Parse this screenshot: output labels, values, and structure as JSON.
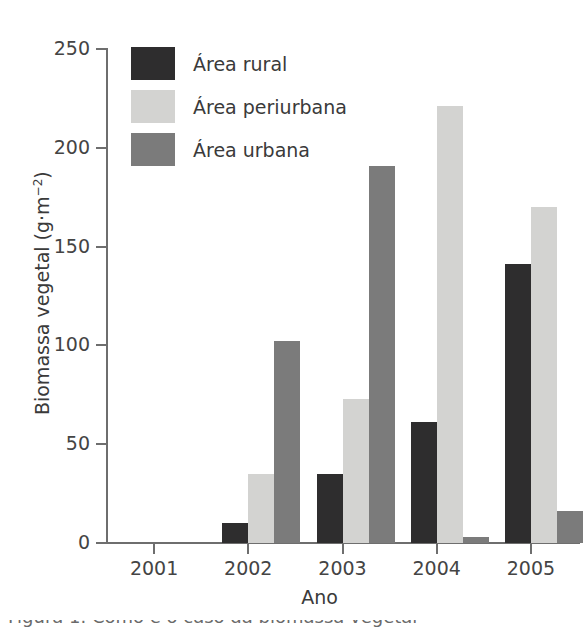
{
  "chart_data": {
    "type": "bar",
    "title": "",
    "xlabel": "Ano",
    "ylabel": "Biomassa vegetal (g·m⁻²)",
    "ylabel_main": "Biomassa vegetal (g·m",
    "ylabel_exp": "−2",
    "ylabel_close": ")",
    "categories": [
      "2001",
      "2002",
      "2003",
      "2004",
      "2005"
    ],
    "series": [
      {
        "name": "Área rural",
        "color": "#2e2d2e",
        "values": [
          0,
          10,
          35,
          61,
          141
        ]
      },
      {
        "name": "Área periurbana",
        "color": "#d3d3d1",
        "values": [
          0,
          35,
          73,
          221,
          170
        ]
      },
      {
        "name": "Área urbana",
        "color": "#7b7b7b",
        "values": [
          0,
          102,
          191,
          3,
          16
        ]
      }
    ],
    "ylim": [
      0,
      250
    ],
    "yticks": [
      0,
      50,
      100,
      150,
      200,
      250
    ],
    "ytick_labels": [
      "0",
      "50",
      "100",
      "150",
      "200",
      "250"
    ],
    "grid": false,
    "legend_position": "top-left",
    "bar_width_px": 26,
    "group_gap_px": 6
  },
  "legend": {
    "items": [
      {
        "label": "Área rural",
        "color": "#2e2d2e"
      },
      {
        "label": "Área periurbana",
        "color": "#d3d3d1"
      },
      {
        "label": "Área urbana",
        "color": "#7b7b7b"
      }
    ]
  },
  "caption": {
    "partial_line": "cut-off caption text below figure"
  }
}
